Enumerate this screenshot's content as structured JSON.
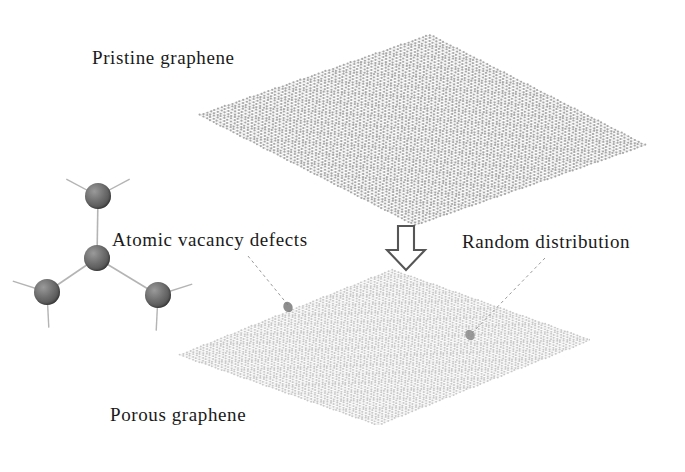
{
  "figure": {
    "background_color": "#ffffff",
    "text_color": "#1a1a1a"
  },
  "labels": {
    "pristine": "Pristine graphene",
    "defects": "Atomic vacancy defects",
    "random": "Random distribution",
    "porous": "Porous graphene"
  },
  "arrow": {
    "direction": "down",
    "style": "hollow-block",
    "outline_color": "#565656",
    "fill_color": "#ffffff"
  },
  "sheets": [
    {
      "name": "pristine-graphene-sheet",
      "lattice": "honeycomb",
      "color": "#a8a8a8",
      "defects": 0,
      "corners": {
        "left": "200,115",
        "top": "415,35",
        "right": "645,145",
        "bottom": "400,225"
      }
    },
    {
      "name": "porous-graphene-sheet",
      "lattice": "honeycomb",
      "color": "#c9c9c9",
      "defects": 2,
      "corners": {
        "left": "180,355",
        "top": "390,270",
        "right": "590,340",
        "bottom": "360,425"
      }
    }
  ],
  "vacancy_markers": [
    {
      "name": "vacancy-marker-1",
      "x": 288,
      "y": 307,
      "color": "#7a7a7a"
    },
    {
      "name": "vacancy-marker-2",
      "x": 470,
      "y": 335,
      "color": "#8a8a8a"
    }
  ],
  "leader_lines": [
    {
      "name": "leader-line-defects",
      "from": "248,256",
      "to": "288,305",
      "style": "dashed",
      "color": "#9b9b9b"
    },
    {
      "name": "leader-line-random",
      "from": "545,258",
      "to": "472,333",
      "style": "dashed",
      "color": "#9b9b9b"
    }
  ],
  "defect_molecule": {
    "name": "atomic-vacancy-defect-model",
    "atom_color": "#5e5e5e",
    "bond_color": "#b4b4b4",
    "atoms": [
      {
        "name": "atom-center",
        "x": 97,
        "y": 258,
        "r": 13
      },
      {
        "name": "atom-top",
        "x": 98,
        "y": 196,
        "r": 13
      },
      {
        "name": "atom-lower-left",
        "x": 47,
        "y": 292,
        "r": 13
      },
      {
        "name": "atom-lower-right",
        "x": 158,
        "y": 295,
        "r": 13
      }
    ],
    "bonds": [
      {
        "from": "atom-center",
        "to": "atom-top"
      },
      {
        "from": "atom-center",
        "to": "atom-lower-left"
      },
      {
        "from": "atom-center",
        "to": "atom-lower-right"
      }
    ],
    "stub_count": 6
  }
}
